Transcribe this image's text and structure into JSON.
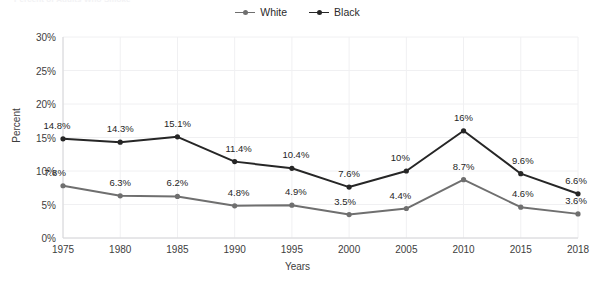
{
  "title": "Percent of Adults Who Smoke",
  "axis": {
    "ylabel": "Percent",
    "xlabel": "Years",
    "yticks": [
      "0%",
      "5%",
      "10%",
      "15%",
      "20%",
      "25%",
      "30%"
    ],
    "xticks": [
      "1975",
      "1980",
      "1985",
      "1990",
      "1995",
      "2000",
      "2005",
      "2010",
      "2015",
      "2018"
    ]
  },
  "legend": [
    {
      "label": "White",
      "color": "#6f6f6f"
    },
    {
      "label": "Black",
      "color": "#262626"
    }
  ],
  "chart_data": {
    "type": "line",
    "title": "Percent of Adults Who Smoke",
    "xlabel": "Years",
    "ylabel": "Percent",
    "categories": [
      "1975",
      "1980",
      "1985",
      "1990",
      "1995",
      "2000",
      "2005",
      "2010",
      "2015",
      "2018"
    ],
    "ylim": [
      0,
      30
    ],
    "ytick_step": 5,
    "grid": true,
    "legend_position": "top-center",
    "series": [
      {
        "name": "White",
        "color": "#6f6f6f",
        "values": [
          7.8,
          6.3,
          6.2,
          4.8,
          4.9,
          3.5,
          4.4,
          8.7,
          4.6,
          3.6
        ],
        "labels": [
          "7.8%",
          "6.3%",
          "6.2%",
          "4.8%",
          "4.9%",
          "3.5%",
          "4.4%",
          "8.7%",
          "4.6%",
          "3.6%"
        ]
      },
      {
        "name": "Black",
        "color": "#262626",
        "values": [
          14.8,
          14.3,
          15.1,
          11.4,
          10.4,
          7.6,
          10,
          16,
          9.6,
          6.6
        ],
        "labels": [
          "14.8%",
          "14.3%",
          "15.1%",
          "11.4%",
          "10.4%",
          "7.6%",
          "10%",
          "16%",
          "9.6%",
          "6.6%"
        ]
      }
    ]
  }
}
